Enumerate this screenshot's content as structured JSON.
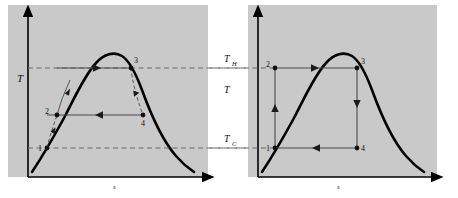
{
  "figure": {
    "background_color": "#ffffff",
    "panel_color": "#c9c9c9",
    "curve_color": "#000000",
    "process_line_color": "#555555",
    "dashed_color": "#666666"
  },
  "left_panel": {
    "name": "rankine-cycle-diagram",
    "y_axis_label": "T",
    "x_axis_label": "s",
    "states": [
      {
        "id": "1",
        "label": "1",
        "x": 47,
        "y": 148
      },
      {
        "id": "2",
        "label": "2",
        "x": 57,
        "y": 115
      },
      {
        "id": "3",
        "label": "3",
        "x": 131,
        "y": 68
      },
      {
        "id": "4",
        "label": "4",
        "x": 143,
        "y": 115
      }
    ],
    "processes": [
      {
        "name": "pump-1-2",
        "style": "dashed",
        "from": "1",
        "to": "2"
      },
      {
        "name": "boiler-2-3",
        "style": "solid",
        "from": "2",
        "to": "3"
      },
      {
        "name": "turbine-3-4",
        "style": "dashed",
        "from": "3",
        "to": "4"
      },
      {
        "name": "condenser-4-1",
        "style": "solid",
        "from": "4",
        "to": "1"
      }
    ]
  },
  "right_panel": {
    "name": "carnot-cycle-diagram",
    "y_axis_label": "T",
    "x_axis_label": "s",
    "states": [
      {
        "id": "1",
        "label": "1",
        "x": 275,
        "y": 148
      },
      {
        "id": "2",
        "label": "2",
        "x": 275,
        "y": 68
      },
      {
        "id": "3",
        "label": "3",
        "x": 357,
        "y": 68
      },
      {
        "id": "4",
        "label": "4",
        "x": 357,
        "y": 148
      }
    ],
    "processes": [
      {
        "name": "compression-1-2",
        "style": "solid",
        "from": "1",
        "to": "2"
      },
      {
        "name": "heat-addition-2-3",
        "style": "solid",
        "from": "2",
        "to": "3"
      },
      {
        "name": "expansion-3-4",
        "style": "solid",
        "from": "3",
        "to": "4"
      },
      {
        "name": "heat-rejection-4-1",
        "style": "solid",
        "from": "4",
        "to": "1"
      }
    ]
  },
  "temperature_lines": {
    "hot": {
      "symbol": "T",
      "subscript": "H",
      "y": 68
    },
    "cold": {
      "symbol": "T",
      "subscript": "C",
      "y": 148
    },
    "center_axis": {
      "symbol": "T"
    }
  }
}
